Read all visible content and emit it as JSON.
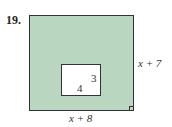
{
  "problem": {
    "number": "19."
  },
  "diagram": {
    "outer_rect": {
      "width_label": "x + 8",
      "height_label": "x + 7",
      "fill": "#b9d6c1"
    },
    "inner_rect": {
      "width_label": "4",
      "height_label": "3",
      "fill": "#ffffff"
    }
  }
}
